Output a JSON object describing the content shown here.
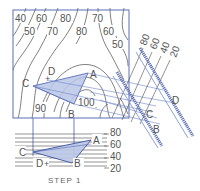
{
  "figure": {
    "caption": "STEP 1",
    "colors": {
      "frame": "#5a6fb8",
      "contour": "#4a4a4a",
      "construction": "#6f86c8",
      "plane_fill": "#b9c6e6",
      "text": "#555555"
    }
  },
  "plan_view": {
    "contour_labels_top_row": [
      "40",
      "60",
      "80",
      "70"
    ],
    "contour_labels_second_row": [
      "50",
      "70",
      "80",
      "60"
    ],
    "contour_label_right": "50",
    "contour_labels_inner": [
      "90",
      "100"
    ],
    "points": {
      "A": "A",
      "B": "B",
      "C": "C",
      "D": "D"
    }
  },
  "elevation_view": {
    "scale_labels": [
      "80",
      "60",
      "40",
      "20"
    ],
    "points": {
      "A": "A",
      "B": "B",
      "C": "C",
      "D": "D"
    }
  },
  "edge_view": {
    "scale_labels": [
      "80",
      "60",
      "40",
      "20"
    ],
    "points": {
      "B": "B",
      "C": "C",
      "D": "D"
    }
  }
}
